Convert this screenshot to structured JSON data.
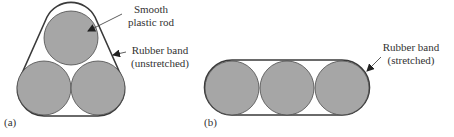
{
  "figure": {
    "panel_a": {
      "label": "(a)",
      "annotation_rod": [
        "Smooth",
        "plastic rod"
      ],
      "annotation_band": [
        "Rubber band",
        "(unstretched)"
      ]
    },
    "panel_b": {
      "label": "(b)",
      "annotation_band": [
        "Rubber band",
        "(stretched)"
      ]
    }
  },
  "colors": {
    "rod_fill": "#a6a6a6",
    "outline": "#3a3a3a",
    "text": "#333333"
  }
}
